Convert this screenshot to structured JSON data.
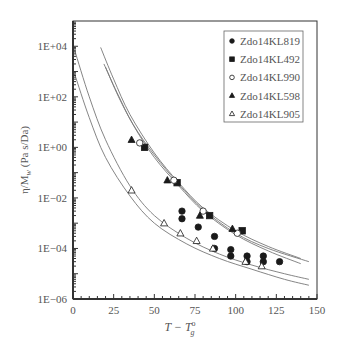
{
  "chart_data": {
    "type": "scatter",
    "title": "",
    "xlabel": "T − T°g",
    "ylabel": "η/Mw (Pa s/Da)",
    "xlim": [
      0,
      150
    ],
    "ylim_log10": [
      -6,
      5
    ],
    "x_ticks": [
      "0",
      "25",
      "50",
      "75",
      "100",
      "125",
      "150"
    ],
    "y_ticks": [
      "1E−06",
      "1E−04",
      "1E−02",
      "1E+00",
      "1E+02",
      "1E+04"
    ],
    "grid": false,
    "legend_position": "upper right",
    "series": [
      {
        "name": "Zdo14KL819",
        "marker": "filled-circle",
        "x": [
          67,
          67,
          77,
          87,
          87,
          97,
          97,
          107,
          107,
          117,
          117,
          127
        ],
        "y": [
          0.003,
          0.0015,
          0.0007,
          0.0003,
          0.0001,
          9e-05,
          5e-05,
          5e-05,
          3e-05,
          5e-05,
          3e-05,
          3e-05
        ]
      },
      {
        "name": "Zdo14KL492",
        "marker": "filled-square",
        "x": [
          44,
          64,
          84,
          104
        ],
        "y": [
          1.0,
          0.04,
          0.002,
          0.0005
        ]
      },
      {
        "name": "Zdo14KL990",
        "marker": "open-circle",
        "x": [
          41,
          62,
          80,
          101
        ],
        "y": [
          1.5,
          0.05,
          0.003,
          0.0004
        ]
      },
      {
        "name": "Zdo14KL598",
        "marker": "filled-triangle",
        "x": [
          36,
          58,
          78,
          98
        ],
        "y": [
          2.0,
          0.05,
          0.002,
          0.0006
        ]
      },
      {
        "name": "Zdo14KL905",
        "marker": "open-triangle",
        "x": [
          36,
          56,
          66,
          76,
          86,
          106,
          116
        ],
        "y": [
          0.02,
          0.001,
          0.0004,
          0.0002,
          0.0001,
          3e-05,
          2e-05
        ]
      }
    ],
    "fit_curves": [
      {
        "points": [
          [
            17,
            9000
          ],
          [
            25,
            500
          ],
          [
            35,
            20
          ],
          [
            50,
            0.6
          ],
          [
            65,
            0.04
          ],
          [
            80,
            0.004
          ],
          [
            100,
            0.0005
          ],
          [
            120,
            0.00012
          ],
          [
            140,
            4e-05
          ]
        ]
      },
      {
        "points": [
          [
            19,
            2000
          ],
          [
            27,
            150
          ],
          [
            37,
            8
          ],
          [
            50,
            0.5
          ],
          [
            65,
            0.035
          ],
          [
            80,
            0.0035
          ],
          [
            100,
            0.0004
          ],
          [
            120,
            0.0001
          ],
          [
            145,
            3e-05
          ]
        ]
      },
      {
        "points": [
          [
            20,
            1500
          ],
          [
            28,
            100
          ],
          [
            38,
            6
          ],
          [
            50,
            0.4
          ],
          [
            65,
            0.03
          ],
          [
            80,
            0.003
          ],
          [
            100,
            0.00035
          ],
          [
            120,
            8e-05
          ],
          [
            140,
            2.5e-05
          ]
        ]
      },
      {
        "points": [
          [
            1,
            7000
          ],
          [
            10,
            100
          ],
          [
            20,
            2
          ],
          [
            35,
            0.03
          ],
          [
            50,
            0.002
          ],
          [
            70,
            0.00025
          ],
          [
            90,
            6e-05
          ],
          [
            110,
            2.2e-05
          ],
          [
            130,
            1e-05
          ],
          [
            145,
            6e-06
          ]
        ]
      },
      {
        "points": [
          [
            1,
            800
          ],
          [
            10,
            15
          ],
          [
            20,
            0.4
          ],
          [
            35,
            0.012
          ],
          [
            50,
            0.001
          ],
          [
            70,
            0.00015
          ],
          [
            90,
            4e-05
          ],
          [
            110,
            1.5e-05
          ],
          [
            130,
            6e-06
          ],
          [
            145,
            3.5e-06
          ]
        ]
      }
    ]
  },
  "legend": {
    "items": [
      {
        "label": "Zdo14KL819",
        "marker": "filled-circle"
      },
      {
        "label": "Zdo14KL492",
        "marker": "filled-square"
      },
      {
        "label": "Zdo14KL990",
        "marker": "open-circle"
      },
      {
        "label": "Zdo14KL598",
        "marker": "filled-triangle"
      },
      {
        "label": "Zdo14KL905",
        "marker": "open-triangle"
      }
    ]
  },
  "axes": {
    "xlabel_main": "T − T",
    "xlabel_sup": "o",
    "xlabel_sub": "g",
    "ylabel": "η/M",
    "ylabel_sub": "w",
    "ylabel_units": " (Pa s/Da)"
  },
  "colors": {
    "axis": "#333333",
    "marker": "#1a1a1a",
    "curve": "#777777",
    "text": "#555555"
  }
}
